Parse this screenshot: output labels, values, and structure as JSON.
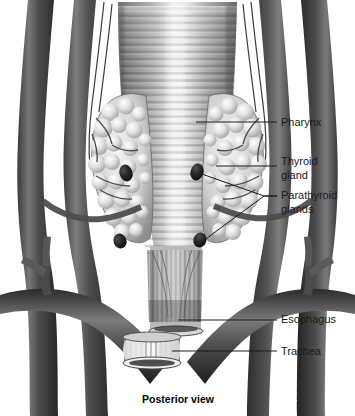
{
  "figure": {
    "caption": "Posterior view",
    "background_color": "#ffffff",
    "line_color": "#1d1d1d",
    "text_color": "#1a1a1a",
    "style": "grayscale medical illustration"
  },
  "labels": [
    {
      "id": "pharynx",
      "text": "Pharynx",
      "text2": "",
      "x": 281,
      "y": 123
    },
    {
      "id": "thyroid-gland",
      "text": "Thyroid",
      "text2": "gland",
      "x": 281,
      "y": 162
    },
    {
      "id": "parathyroid-glands",
      "text": "Parathyroid",
      "text2": "glands",
      "x": 281,
      "y": 196
    },
    {
      "id": "esophagus",
      "text": "Esophagus",
      "text2": "",
      "x": 281,
      "y": 320
    },
    {
      "id": "trachea",
      "text": "Trachea",
      "text2": "",
      "x": 281,
      "y": 352
    }
  ],
  "structures": [
    {
      "id": "pharynx",
      "name": "Pharynx",
      "description": "Central striated muscular tube, superior"
    },
    {
      "id": "thyroid-left-lobe",
      "name": "Thyroid gland lobe",
      "description": "Left lobulated gland mass"
    },
    {
      "id": "thyroid-right-lobe",
      "name": "Thyroid gland lobe",
      "description": "Right lobulated gland mass"
    },
    {
      "id": "parathyroid-superior-left",
      "name": "Parathyroid gland",
      "description": "Dark oval, superior left"
    },
    {
      "id": "parathyroid-inferior-left",
      "name": "Parathyroid gland",
      "description": "Dark oval, inferior left"
    },
    {
      "id": "parathyroid-superior-right",
      "name": "Parathyroid gland",
      "description": "Dark oval, superior right"
    },
    {
      "id": "parathyroid-inferior-right",
      "name": "Parathyroid gland",
      "description": "Dark oval, inferior right"
    },
    {
      "id": "esophagus",
      "name": "Esophagus",
      "description": "Vertically striated tube, inferior"
    },
    {
      "id": "trachea",
      "name": "Trachea",
      "description": "Cut cartilaginous cylinder at base"
    },
    {
      "id": "vessels",
      "name": "Blood vessels",
      "description": "Dark carotid and subclavian vessels"
    }
  ]
}
